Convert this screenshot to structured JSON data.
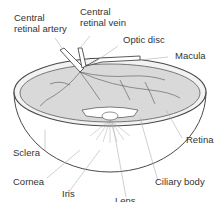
{
  "diagram": {
    "labels": [
      {
        "id": "central-retinal-artery",
        "text": "Central\nretinal artery"
      },
      {
        "id": "central-retinal-vein",
        "text": "Central\nretinal vein"
      },
      {
        "id": "optic-disc",
        "text": "Optic disc"
      },
      {
        "id": "macula",
        "text": "Macula"
      },
      {
        "id": "retina",
        "text": "Retina"
      },
      {
        "id": "sclera",
        "text": "Sclera"
      },
      {
        "id": "cornea",
        "text": "Cornea"
      },
      {
        "id": "iris",
        "text": "Iris"
      },
      {
        "id": "lens",
        "text": "Lens"
      },
      {
        "id": "ciliary-body",
        "text": "Ciliary body"
      }
    ],
    "colors": {
      "outline": "#4a4a4a",
      "leader": "#b0b0b0",
      "retina_fill": "#d9d9d9",
      "text": "#333333"
    }
  }
}
